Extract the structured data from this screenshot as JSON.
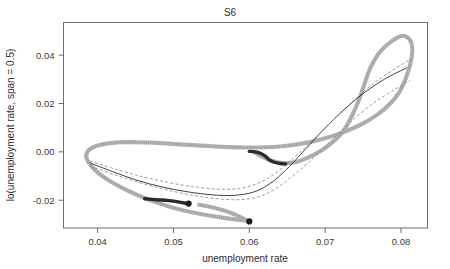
{
  "chart_data": {
    "type": "scatter",
    "title": "S6",
    "xlabel": "unemployment rate",
    "ylabel": "lo(unemployment rate, span = 0.5)",
    "xlim": [
      0.0355,
      0.0835
    ],
    "ylim": [
      -0.0315,
      0.0535
    ],
    "grid": false,
    "legend": null,
    "xticks": [
      0.04,
      0.05,
      0.06,
      0.07,
      0.08
    ],
    "xticklabels": [
      "0.04",
      "0.05",
      "0.06",
      "0.07",
      "0.08"
    ],
    "yticks": [
      -0.02,
      0.0,
      0.02,
      0.04
    ],
    "yticklabels": [
      "-0.02",
      "0.00",
      "0.02",
      "0.04"
    ],
    "series": [
      {
        "name": "phase-loop-trajectory",
        "style": "open-circle-markers-gray",
        "points": [
          [
            0.0605,
            0.0
          ],
          [
            0.061,
            -0.0008
          ],
          [
            0.0618,
            -0.0022
          ],
          [
            0.0628,
            -0.0036
          ],
          [
            0.064,
            -0.0044
          ],
          [
            0.0652,
            -0.0046
          ],
          [
            0.0664,
            -0.004
          ],
          [
            0.0676,
            -0.0026
          ],
          [
            0.069,
            -0.0004
          ],
          [
            0.0706,
            0.003
          ],
          [
            0.0722,
            0.0078
          ],
          [
            0.0734,
            0.014
          ],
          [
            0.0744,
            0.021
          ],
          [
            0.0752,
            0.0282
          ],
          [
            0.076,
            0.035
          ],
          [
            0.0772,
            0.0412
          ],
          [
            0.0788,
            0.0458
          ],
          [
            0.0802,
            0.048
          ],
          [
            0.0812,
            0.0462
          ],
          [
            0.0815,
            0.0418
          ],
          [
            0.0812,
            0.036
          ],
          [
            0.0806,
            0.03
          ],
          [
            0.0798,
            0.0248
          ],
          [
            0.0786,
            0.02
          ],
          [
            0.0768,
            0.0152
          ],
          [
            0.0744,
            0.0108
          ],
          [
            0.0712,
            0.0068
          ],
          [
            0.0676,
            0.0038
          ],
          [
            0.064,
            0.0022
          ],
          [
            0.06,
            0.0018
          ],
          [
            0.0558,
            0.0022
          ],
          [
            0.0514,
            0.003
          ],
          [
            0.0472,
            0.0038
          ],
          [
            0.0436,
            0.004
          ],
          [
            0.0408,
            0.0032
          ],
          [
            0.039,
            0.0012
          ],
          [
            0.0385,
            -0.0018
          ],
          [
            0.039,
            -0.0052
          ],
          [
            0.0402,
            -0.009
          ],
          [
            0.042,
            -0.0128
          ],
          [
            0.0442,
            -0.0164
          ],
          [
            0.0468,
            -0.0198
          ],
          [
            0.0496,
            -0.0228
          ],
          [
            0.0524,
            -0.025
          ],
          [
            0.0552,
            -0.0266
          ],
          [
            0.0578,
            -0.0278
          ],
          [
            0.0598,
            -0.0285
          ]
        ]
      },
      {
        "name": "inner-lower-loop",
        "style": "open-circle-markers-gray",
        "points": [
          [
            0.0532,
            -0.0218
          ],
          [
            0.0552,
            -0.023
          ],
          [
            0.0572,
            -0.0248
          ],
          [
            0.0586,
            -0.0266
          ],
          [
            0.0596,
            -0.0282
          ],
          [
            0.06,
            -0.0288
          ]
        ]
      },
      {
        "name": "loess-fit",
        "style": "solid-dark",
        "points": [
          [
            0.039,
            -0.0046
          ],
          [
            0.042,
            -0.0082
          ],
          [
            0.0452,
            -0.0118
          ],
          [
            0.0486,
            -0.0146
          ],
          [
            0.052,
            -0.0166
          ],
          [
            0.0552,
            -0.0178
          ],
          [
            0.058,
            -0.018
          ],
          [
            0.0606,
            -0.0166
          ],
          [
            0.0628,
            -0.013
          ],
          [
            0.0648,
            -0.0076
          ],
          [
            0.0668,
            -0.001
          ],
          [
            0.0692,
            0.0072
          ],
          [
            0.0718,
            0.0154
          ],
          [
            0.0748,
            0.0236
          ],
          [
            0.0778,
            0.03
          ],
          [
            0.0808,
            0.0348
          ]
        ]
      },
      {
        "name": "confidence-upper",
        "style": "dashed-gray",
        "points": [
          [
            0.039,
            -0.0038
          ],
          [
            0.0424,
            -0.0072
          ],
          [
            0.0458,
            -0.0102
          ],
          [
            0.0492,
            -0.0126
          ],
          [
            0.0526,
            -0.0144
          ],
          [
            0.0558,
            -0.0154
          ],
          [
            0.0586,
            -0.0152
          ],
          [
            0.061,
            -0.0132
          ],
          [
            0.0632,
            -0.0094
          ],
          [
            0.0654,
            -0.0038
          ],
          [
            0.0678,
            0.003
          ],
          [
            0.0704,
            0.0112
          ],
          [
            0.0732,
            0.0196
          ],
          [
            0.0762,
            0.0278
          ],
          [
            0.0792,
            0.0344
          ],
          [
            0.0812,
            0.0382
          ]
        ]
      },
      {
        "name": "confidence-lower",
        "style": "dashed-gray",
        "points": [
          [
            0.039,
            -0.006
          ],
          [
            0.0424,
            -0.0096
          ],
          [
            0.0458,
            -0.013
          ],
          [
            0.0492,
            -0.0158
          ],
          [
            0.0526,
            -0.018
          ],
          [
            0.0558,
            -0.0194
          ],
          [
            0.0586,
            -0.0198
          ],
          [
            0.061,
            -0.0188
          ],
          [
            0.0632,
            -0.0158
          ],
          [
            0.0654,
            -0.0108
          ],
          [
            0.0678,
            -0.0044
          ],
          [
            0.0704,
            0.0034
          ],
          [
            0.0732,
            0.0118
          ],
          [
            0.0762,
            0.0198
          ],
          [
            0.0792,
            0.0258
          ],
          [
            0.0812,
            0.0296
          ]
        ]
      },
      {
        "name": "dark-hook-center",
        "style": "thick-dark",
        "points": [
          [
            0.06,
            0.0002
          ],
          [
            0.0608,
            0.0
          ],
          [
            0.0616,
            -0.0008
          ],
          [
            0.0622,
            -0.002
          ],
          [
            0.0626,
            -0.0032
          ],
          [
            0.0632,
            -0.0042
          ],
          [
            0.064,
            -0.0048
          ],
          [
            0.0648,
            -0.005
          ]
        ]
      },
      {
        "name": "dark-segment-lower-left",
        "style": "thick-dark",
        "points": [
          [
            0.0462,
            -0.0194
          ],
          [
            0.0478,
            -0.0198
          ],
          [
            0.0494,
            -0.0202
          ],
          [
            0.0508,
            -0.0208
          ],
          [
            0.0518,
            -0.0214
          ]
        ]
      }
    ],
    "endpoints": [
      {
        "name": "endpoint-lower-left",
        "x": 0.052,
        "y": -0.0214
      },
      {
        "name": "endpoint-lower-right",
        "x": 0.06,
        "y": -0.0288
      }
    ]
  }
}
